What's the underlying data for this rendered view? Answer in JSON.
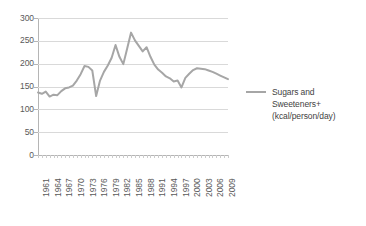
{
  "chart_data": {
    "type": "line",
    "title": "",
    "subtitle": "",
    "xlabel": "",
    "ylabel": "",
    "xlim": [
      1961,
      2010
    ],
    "ylim": [
      0,
      300
    ],
    "ytick_step": 50,
    "ytick_labels": [
      "0",
      "50",
      "100",
      "150",
      "200",
      "250",
      "300"
    ],
    "ytick_values": [
      0,
      50,
      100,
      150,
      200,
      250,
      300
    ],
    "xtick_labels": [
      "1961",
      "1964",
      "1967",
      "1970",
      "1973",
      "1976",
      "1979",
      "1982",
      "1985",
      "1988",
      "1991",
      "1994",
      "1997",
      "2000",
      "2003",
      "2006",
      "2009"
    ],
    "xtick_values": [
      1961,
      1964,
      1967,
      1970,
      1973,
      1976,
      1979,
      1982,
      1985,
      1988,
      1991,
      1994,
      1997,
      2000,
      2003,
      2006,
      2009
    ],
    "grid": true,
    "grid_axis": "y",
    "legend_position": "right",
    "series": [
      {
        "name": "Sugars and Sweeteners+ (kcal/person/day)",
        "color": "#a6a6a6",
        "x": [
          1961,
          1962,
          1963,
          1964,
          1965,
          1966,
          1967,
          1968,
          1969,
          1970,
          1971,
          1972,
          1973,
          1974,
          1975,
          1976,
          1977,
          1978,
          1979,
          1980,
          1981,
          1982,
          1983,
          1984,
          1985,
          1986,
          1987,
          1988,
          1989,
          1990,
          1991,
          1992,
          1993,
          1994,
          1995,
          1996,
          1997,
          1998,
          1999,
          2000,
          2001,
          2002,
          2003,
          2004,
          2005,
          2006,
          2007,
          2008,
          2009,
          2010
        ],
        "values": [
          137,
          134,
          139,
          128,
          132,
          131,
          140,
          146,
          148,
          152,
          163,
          177,
          195,
          193,
          185,
          129,
          163,
          182,
          196,
          213,
          241,
          215,
          199,
          233,
          268,
          251,
          239,
          227,
          236,
          215,
          198,
          187,
          180,
          172,
          168,
          161,
          163,
          148,
          169,
          178,
          186,
          190,
          189,
          188,
          185,
          182,
          178,
          174,
          170,
          166
        ]
      }
    ]
  },
  "legend": {
    "label_line1": "Sugars and",
    "label_line2": "Sweeteners+",
    "label_line3": "(kcal/person/day)",
    "swatch_color": "#a6a6a6"
  },
  "colors": {
    "series": "#a6a6a6",
    "grid": "#d9d9d9",
    "axis": "#b5b5b5",
    "tick_text": "#595959",
    "legend_text": "#3f3f3f",
    "background": "#ffffff"
  }
}
